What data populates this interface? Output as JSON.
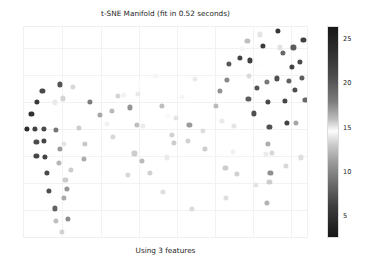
{
  "figure": {
    "width": 366,
    "height": 269,
    "background": "#ffffff"
  },
  "chart_data": {
    "type": "scatter",
    "title": "t-SNE Manifold (fit in 0.52 seconds)",
    "caption": "Using 3 features",
    "xlabel": "",
    "ylabel": "",
    "grid": true,
    "xticklabels": [],
    "yticklabels": [],
    "xlim": [
      -31.0,
      31.0
    ],
    "ylim": [
      -26.0,
      26.0
    ],
    "legend": "none",
    "colorbar": {
      "position": "right",
      "label": "",
      "colormap": "binary-diverging-gray",
      "vmin": 2.5,
      "vmax": 26.5,
      "ticks": [
        5,
        10,
        15,
        20,
        25
      ],
      "tick_labels": [
        "5",
        "10",
        "15",
        "20",
        "25"
      ],
      "dark_at": [
        2.5,
        26.5
      ],
      "light_at": 14.5,
      "gradient_stops": [
        {
          "value": 26.5,
          "color": "#171717"
        },
        {
          "value": 24.0,
          "color": "#2b2b2b"
        },
        {
          "value": 21.0,
          "color": "#4a4a4a"
        },
        {
          "value": 18.0,
          "color": "#7c7c7c"
        },
        {
          "value": 16.0,
          "color": "#bcbcbc"
        },
        {
          "value": 14.6,
          "color": "#fdfdfd"
        },
        {
          "value": 13.2,
          "color": "#cfcfcf"
        },
        {
          "value": 11.0,
          "color": "#9a9a9a"
        },
        {
          "value": 8.5,
          "color": "#6a6a6a"
        },
        {
          "value": 6.0,
          "color": "#3d3d3d"
        },
        {
          "value": 2.5,
          "color": "#161616"
        }
      ]
    },
    "marker": {
      "shape": "circle",
      "size_px": 5.2,
      "alpha": 0.95
    },
    "points": [
      {
        "x": -30.4,
        "y": 1.0,
        "c": 25.4
      },
      {
        "x": -28.6,
        "y": 1.0,
        "c": 22.8
      },
      {
        "x": -26.6,
        "y": 1.0,
        "c": 22.1
      },
      {
        "x": -29.4,
        "y": 4.6,
        "c": 24.6
      },
      {
        "x": -28.2,
        "y": 7.6,
        "c": 23.6
      },
      {
        "x": -27.0,
        "y": 10.4,
        "c": 22.0
      },
      {
        "x": -23.1,
        "y": 11.9,
        "c": 20.9
      },
      {
        "x": -28.3,
        "y": -2.2,
        "c": 21.8
      },
      {
        "x": -26.6,
        "y": -2.0,
        "c": 22.5
      },
      {
        "x": -28.3,
        "y": -5.6,
        "c": 22.3
      },
      {
        "x": -26.4,
        "y": -5.8,
        "c": 22.6
      },
      {
        "x": -26.1,
        "y": -9.8,
        "c": 22.0
      },
      {
        "x": -25.6,
        "y": -14.2,
        "c": 21.5
      },
      {
        "x": -24.2,
        "y": -18.5,
        "c": 20.0
      },
      {
        "x": -24.0,
        "y": 0.8,
        "c": 18.8
      },
      {
        "x": -23.2,
        "y": -4.0,
        "c": 17.2
      },
      {
        "x": -23.4,
        "y": -7.3,
        "c": 12.0
      },
      {
        "x": -22.0,
        "y": -11.6,
        "c": 12.9
      },
      {
        "x": -21.6,
        "y": -13.8,
        "c": 10.5
      },
      {
        "x": -22.4,
        "y": -16.0,
        "c": 11.5
      },
      {
        "x": -21.4,
        "y": -21.0,
        "c": 10.0
      },
      {
        "x": -24.0,
        "y": 5.1,
        "c": 14.6
      },
      {
        "x": -24.2,
        "y": 7.5,
        "c": 14.0
      },
      {
        "x": -22.6,
        "y": 8.5,
        "c": 13.3
      },
      {
        "x": -22.4,
        "y": -2.6,
        "c": 13.8
      },
      {
        "x": -20.4,
        "y": 11.4,
        "c": 13.4
      },
      {
        "x": -19.0,
        "y": 1.2,
        "c": 13.0
      },
      {
        "x": -18.0,
        "y": -6.4,
        "c": 11.6
      },
      {
        "x": -17.8,
        "y": -2.6,
        "c": 12.8
      },
      {
        "x": -16.6,
        "y": 7.6,
        "c": 18.4
      },
      {
        "x": -14.4,
        "y": 4.4,
        "c": 16.8
      },
      {
        "x": -13.0,
        "y": 2.2,
        "c": 14.2
      },
      {
        "x": -11.6,
        "y": -1.0,
        "c": 13.4
      },
      {
        "x": -11.8,
        "y": 5.4,
        "c": 16.2
      },
      {
        "x": -10.6,
        "y": 9.0,
        "c": 15.5
      },
      {
        "x": -9.2,
        "y": 9.4,
        "c": 14.2
      },
      {
        "x": -8.0,
        "y": 6.3,
        "c": 17.4
      },
      {
        "x": -6.2,
        "y": 9.6,
        "c": 14.0
      },
      {
        "x": -6.0,
        "y": 11.9,
        "c": 14.6
      },
      {
        "x": -6.4,
        "y": 2.0,
        "c": 16.0
      },
      {
        "x": -5.2,
        "y": 1.8,
        "c": 15.0
      },
      {
        "x": -7.0,
        "y": -5.0,
        "c": 13.0
      },
      {
        "x": -5.4,
        "y": -6.8,
        "c": 16.2
      },
      {
        "x": -8.4,
        "y": -10.2,
        "c": 13.4
      },
      {
        "x": -3.6,
        "y": -9.8,
        "c": 13.1
      },
      {
        "x": -2.4,
        "y": 14.0,
        "c": 14.4
      },
      {
        "x": -1.0,
        "y": 6.6,
        "c": 16.0
      },
      {
        "x": 0.4,
        "y": 4.2,
        "c": 14.5
      },
      {
        "x": 1.2,
        "y": -0.4,
        "c": 13.2
      },
      {
        "x": 2.0,
        "y": 3.8,
        "c": 13.8
      },
      {
        "x": 1.6,
        "y": -2.4,
        "c": 13.0
      },
      {
        "x": 0.0,
        "y": -6.0,
        "c": 14.0
      },
      {
        "x": -0.8,
        "y": -14.5,
        "c": 13.6
      },
      {
        "x": 3.4,
        "y": 8.9,
        "c": 14.8
      },
      {
        "x": 5.0,
        "y": 2.0,
        "c": 17.2
      },
      {
        "x": 4.6,
        "y": -2.0,
        "c": 13.2
      },
      {
        "x": 6.2,
        "y": 13.3,
        "c": 15.0
      },
      {
        "x": 8.0,
        "y": 0.6,
        "c": 13.6
      },
      {
        "x": 8.4,
        "y": -4.0,
        "c": 13.0
      },
      {
        "x": 10.8,
        "y": 6.6,
        "c": 16.2
      },
      {
        "x": 11.6,
        "y": 10.3,
        "c": 17.5
      },
      {
        "x": 12.0,
        "y": 3.0,
        "c": 14.0
      },
      {
        "x": 13.6,
        "y": 17.0,
        "c": 20.7
      },
      {
        "x": 13.2,
        "y": 13.0,
        "c": 17.8
      },
      {
        "x": 14.6,
        "y": 1.8,
        "c": 13.8
      },
      {
        "x": 14.4,
        "y": -4.6,
        "c": 14.2
      },
      {
        "x": 12.8,
        "y": -8.6,
        "c": 13.0
      },
      {
        "x": 15.4,
        "y": -10.0,
        "c": 13.2
      },
      {
        "x": 13.0,
        "y": -16.0,
        "c": 13.6
      },
      {
        "x": 16.4,
        "y": 20.6,
        "c": 14.8
      },
      {
        "x": 16.0,
        "y": 18.4,
        "c": 22.6
      },
      {
        "x": 17.6,
        "y": 22.6,
        "c": 16.0
      },
      {
        "x": 18.2,
        "y": 17.8,
        "c": 23.0
      },
      {
        "x": 18.0,
        "y": 14.0,
        "c": 15.4
      },
      {
        "x": 17.8,
        "y": 8.4,
        "c": 20.4
      },
      {
        "x": 19.0,
        "y": 4.8,
        "c": 21.4
      },
      {
        "x": 19.6,
        "y": 11.0,
        "c": 21.0
      },
      {
        "x": 20.4,
        "y": 24.2,
        "c": 13.8
      },
      {
        "x": 21.0,
        "y": 21.4,
        "c": 23.4
      },
      {
        "x": 20.8,
        "y": 17.0,
        "c": 14.6
      },
      {
        "x": 21.8,
        "y": 12.6,
        "c": 18.6
      },
      {
        "x": 22.0,
        "y": 7.6,
        "c": 22.2
      },
      {
        "x": 22.4,
        "y": 1.4,
        "c": 21.2
      },
      {
        "x": 22.0,
        "y": -2.6,
        "c": 16.6
      },
      {
        "x": 21.6,
        "y": -5.2,
        "c": 15.0
      },
      {
        "x": 23.0,
        "y": -4.8,
        "c": 13.4
      },
      {
        "x": 22.6,
        "y": -9.8,
        "c": 17.6
      },
      {
        "x": 21.8,
        "y": -17.2,
        "c": 16.4
      },
      {
        "x": 24.2,
        "y": 25.0,
        "c": 24.0
      },
      {
        "x": 24.6,
        "y": 21.0,
        "c": 15.2
      },
      {
        "x": 24.0,
        "y": 13.4,
        "c": 21.4
      },
      {
        "x": 25.4,
        "y": 19.6,
        "c": 19.6
      },
      {
        "x": 25.8,
        "y": 7.8,
        "c": 22.4
      },
      {
        "x": 26.2,
        "y": 2.4,
        "c": 22.8
      },
      {
        "x": 26.6,
        "y": 12.8,
        "c": 20.0
      },
      {
        "x": 27.2,
        "y": 16.2,
        "c": 22.6
      },
      {
        "x": 27.6,
        "y": 21.0,
        "c": 20.4
      },
      {
        "x": 28.0,
        "y": 10.6,
        "c": 21.6
      },
      {
        "x": 28.2,
        "y": 2.4,
        "c": 16.8
      },
      {
        "x": 29.0,
        "y": 17.4,
        "c": 22.0
      },
      {
        "x": 29.4,
        "y": 13.6,
        "c": 20.4
      },
      {
        "x": 29.8,
        "y": 22.8,
        "c": 22.8
      },
      {
        "x": 30.2,
        "y": 8.2,
        "c": 19.6
      },
      {
        "x": 29.2,
        "y": -6.0,
        "c": 13.6
      },
      {
        "x": 26.0,
        "y": -8.0,
        "c": 13.4
      },
      {
        "x": 22.4,
        "y": -12.0,
        "c": 13.0
      },
      {
        "x": 19.4,
        "y": -12.8,
        "c": 13.8
      },
      {
        "x": 5.6,
        "y": -18.6,
        "c": 13.5
      },
      {
        "x": -22.8,
        "y": -24.2,
        "c": 13.2
      },
      {
        "x": -24.0,
        "y": -21.6,
        "c": 12.4
      },
      {
        "x": -20.8,
        "y": -9.0,
        "c": 13.0
      }
    ],
    "grid_x_px": [
      38,
      77,
      115,
      153,
      191,
      229,
      267
    ],
    "grid_y_px": [
      21,
      48,
      75,
      102,
      129,
      156,
      183
    ]
  }
}
